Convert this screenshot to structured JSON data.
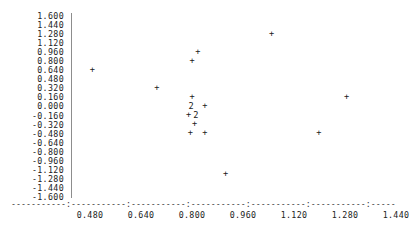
{
  "chart_data": {
    "type": "scatter",
    "title": "",
    "subtitle": "",
    "xlabel": "",
    "ylabel": "",
    "grid": false,
    "legend": "none",
    "marker": "+",
    "overlap_marker": "2",
    "xlim": [
      0.42,
      1.5
    ],
    "ylim": [
      -1.6,
      1.6
    ],
    "xticks": [
      "0.480",
      "0.640",
      "0.800",
      "0.960",
      "1.120",
      "1.280",
      "1.440"
    ],
    "xtick_values": [
      0.48,
      0.64,
      0.8,
      0.96,
      1.12,
      1.28,
      1.44
    ],
    "yticks": [
      "1.600",
      "1.440",
      "1.280",
      "1.120",
      "0.960",
      "0.800",
      "0.640",
      "0.480",
      "0.320",
      "0.160",
      "0.000",
      "-0.160",
      "-0.320",
      "-0.480",
      "-0.640",
      "-0.800",
      "-0.960",
      "-1.120",
      "-1.280",
      "-1.440",
      "-1.600"
    ],
    "ytick_values": [
      1.6,
      1.44,
      1.28,
      1.12,
      0.96,
      0.8,
      0.64,
      0.48,
      0.32,
      0.16,
      0.0,
      -0.16,
      -0.32,
      -0.48,
      -0.64,
      -0.8,
      -0.96,
      -1.12,
      -1.28,
      -1.44,
      -1.6
    ],
    "points": [
      {
        "x": 0.487,
        "y": 0.64,
        "marker": "+",
        "count": 1
      },
      {
        "x": 0.69,
        "y": 0.32,
        "marker": "+",
        "count": 1
      },
      {
        "x": 0.818,
        "y": 0.96,
        "marker": "+",
        "count": 1
      },
      {
        "x": 0.8,
        "y": 0.8,
        "marker": "+",
        "count": 1
      },
      {
        "x": 0.8,
        "y": 0.16,
        "marker": "+",
        "count": 1
      },
      {
        "x": 0.797,
        "y": 0.0,
        "marker": "2",
        "count": 2
      },
      {
        "x": 0.84,
        "y": 0.0,
        "marker": "+",
        "count": 1
      },
      {
        "x": 0.789,
        "y": -0.16,
        "marker": "+",
        "count": 1
      },
      {
        "x": 0.812,
        "y": -0.16,
        "marker": "2",
        "count": 2
      },
      {
        "x": 0.808,
        "y": -0.32,
        "marker": "+",
        "count": 1
      },
      {
        "x": 0.795,
        "y": -0.48,
        "marker": "+",
        "count": 1
      },
      {
        "x": 0.84,
        "y": -0.48,
        "marker": "+",
        "count": 1
      },
      {
        "x": 1.05,
        "y": 1.28,
        "marker": "+",
        "count": 1
      },
      {
        "x": 1.285,
        "y": 0.16,
        "marker": "+",
        "count": 1
      },
      {
        "x": 1.198,
        "y": -0.48,
        "marker": "+",
        "count": 1
      },
      {
        "x": 0.905,
        "y": -1.2,
        "marker": "+",
        "count": 1
      }
    ],
    "axis_rule": "-----------:-----------:-----------:-----------:-----------:-----------:-----------:"
  },
  "colors": {
    "background": "#ffffff",
    "text": "#222222",
    "axis": "#8d8d8d",
    "marker": "#1a1a1a"
  }
}
